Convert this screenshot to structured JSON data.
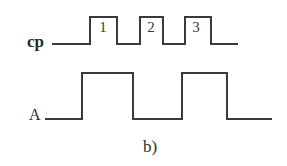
{
  "figure": {
    "caption": "b)",
    "background_color": "#ffffff",
    "trace_color": "#3a3a3a",
    "text_color": "#2b2b2b",
    "width": 287,
    "height": 166
  },
  "signals": [
    {
      "name": "cp",
      "label": "cp",
      "type": "clock",
      "high_y": 17,
      "low_y": 44,
      "lead_in_x": 52,
      "start_x": 90,
      "end_x": 238,
      "pulses": [
        {
          "number": "1",
          "rise_x": 90,
          "fall_x": 117
        },
        {
          "number": "2",
          "rise_x": 140,
          "fall_x": 163
        },
        {
          "number": "3",
          "rise_x": 185,
          "fall_x": 211
        }
      ],
      "path": "M 52 44 L 90 44 L 90 17 L 117 17 L 117 44 L 140 44 L 140 17 L 163 17 L 163 44 L 185 44 L 185 17 L 211 17 L 211 44 L 238 44"
    },
    {
      "name": "A",
      "label": "A",
      "type": "data",
      "high_y": 73,
      "low_y": 119,
      "lead_in_x": 45,
      "start_x": 82,
      "end_x": 272,
      "pulses": [
        {
          "rise_x": 82,
          "fall_x": 133
        },
        {
          "rise_x": 182,
          "fall_x": 227
        }
      ],
      "path": "M 45 119 L 82 119 L 82 73 L 133 73 L 133 119 L 182 119 L 182 73 L 227 73 L 227 119 L 272 119"
    }
  ],
  "pulse_numbers": [
    {
      "text": "1",
      "x": 103,
      "y": 27
    },
    {
      "text": "2",
      "x": 151,
      "y": 27
    },
    {
      "text": "3",
      "x": 196,
      "y": 27
    }
  ]
}
